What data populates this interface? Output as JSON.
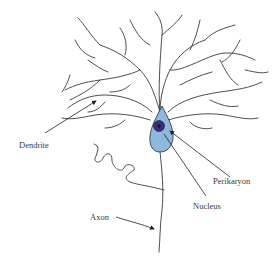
{
  "diagram": {
    "type": "neuron",
    "colors": {
      "cell_body": "#8fb8dc",
      "cell_outline": "#2a3a4a",
      "nucleus": "#3a2f7a",
      "nucleus_center": "#1a1030",
      "lines": "#3a3a3a"
    },
    "labels": {
      "dendrite": "Dendrite",
      "perikaryon": "Perikaryon",
      "nucleus": "Nucleus",
      "axon": "Axon"
    }
  }
}
